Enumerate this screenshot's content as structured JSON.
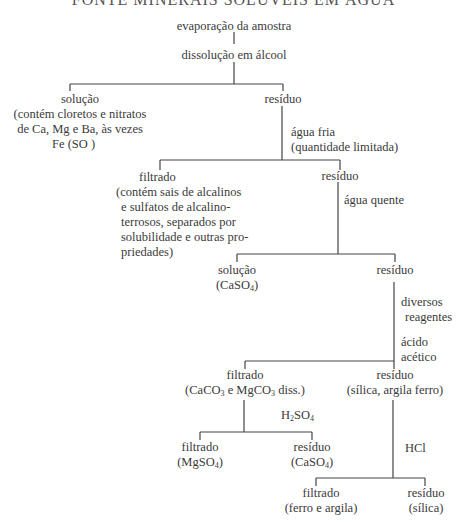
{
  "title": "FONTE MINERAIS SOLÚVEIS EM ÁGUA",
  "nodes": {
    "root": "evaporação da amostra",
    "step1": "dissolução em álcool",
    "sol1": {
      "label": "solução",
      "desc": [
        "(contém cloretos e nitratos",
        "de Ca, Mg e Ba, às vezes",
        "Fe (SO )"
      ]
    },
    "res1": "resíduo",
    "step2": [
      "água fria",
      "(quantidade limitada)"
    ],
    "filt2": {
      "label": "filtrado",
      "desc": [
        "(contém sais de alcalinos",
        "e sulfatos de alcalino-",
        "terrosos, separados por",
        "solubilidade e outras pro-",
        "priedades)"
      ]
    },
    "res2": "resíduo",
    "step3": "água quente",
    "sol3": {
      "label": "solução",
      "formula": "CaSO",
      "sub": "4"
    },
    "res3": "resíduo",
    "step4": [
      "diversos",
      "reagentes"
    ],
    "step5": [
      "ácido",
      "acético"
    ],
    "filt5": {
      "label": "filtrado",
      "desc_a": "(CaCO",
      "sub_a": "3",
      "desc_b": " e MgCO",
      "sub_b": "3",
      "desc_c": " diss.)"
    },
    "res5": {
      "label": "resíduo",
      "desc": "(sílica, argila ferro)"
    },
    "step6": {
      "a": "H",
      "sub_a": "2",
      "b": "SO",
      "sub_b": "4"
    },
    "filt6": {
      "label": "filtrado",
      "formula": "MgSO",
      "sub": "4"
    },
    "res6": {
      "label": "resíduo",
      "formula": "CaSO",
      "sub": "4"
    },
    "step7": "HCl",
    "filt7": {
      "label": "filtrado",
      "desc": "(ferro e argila)"
    },
    "res7": {
      "label": "resíduo",
      "desc": "(sílica)"
    }
  }
}
